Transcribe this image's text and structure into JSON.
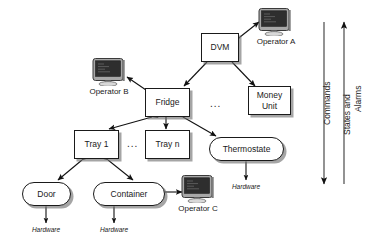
{
  "diagram": {
    "colors": {
      "node_fill": "#ffffff",
      "node_border": "#1a1a1a",
      "shadow": "#6e6e6e",
      "screen": "#2e2e2e",
      "bezel": "#8c8c8c",
      "arrow": "#111111"
    },
    "nodes": [
      {
        "id": "dvm",
        "label": "DVM",
        "shape": "rect"
      },
      {
        "id": "money_unit",
        "label": "Money\nUnit",
        "line1": "Money",
        "line2": "Unit",
        "shape": "rect"
      },
      {
        "id": "fridge",
        "label": "Fridge",
        "shape": "rect"
      },
      {
        "id": "tray1",
        "label": "Tray 1",
        "shape": "rect"
      },
      {
        "id": "trayn",
        "label": "Tray n",
        "shape": "rect"
      },
      {
        "id": "thermostate",
        "label": "Thermostate",
        "shape": "rounded"
      },
      {
        "id": "door",
        "label": "Door",
        "shape": "rounded"
      },
      {
        "id": "container",
        "label": "Container",
        "shape": "rounded"
      }
    ],
    "operators": [
      {
        "id": "operator_a",
        "label": "Operator A",
        "icon": "monitor-icon"
      },
      {
        "id": "operator_b",
        "label": "Operator B",
        "icon": "monitor-icon"
      },
      {
        "id": "operator_c",
        "label": "Operator C",
        "icon": "monitor-icon"
      }
    ],
    "hardware_labels": [
      {
        "id": "hw_thermostate",
        "label": "Hardware"
      },
      {
        "id": "hw_door",
        "label": "Hardware"
      },
      {
        "id": "hw_container",
        "label": "Hardware"
      }
    ],
    "ellipses": [
      {
        "id": "ellipsis_top",
        "label": "..."
      },
      {
        "id": "ellipsis_tray",
        "label": "..."
      }
    ],
    "side_arrows": [
      {
        "id": "commands_arrow",
        "label": "Commands",
        "direction": "down"
      },
      {
        "id": "states_arrow",
        "label": "States and",
        "label2": "Alarms",
        "direction": "up"
      }
    ]
  }
}
